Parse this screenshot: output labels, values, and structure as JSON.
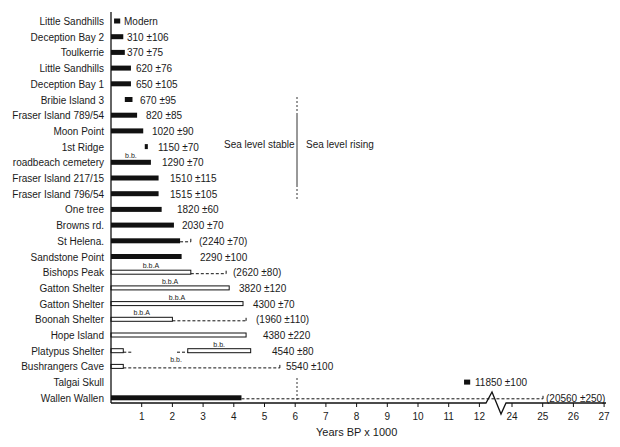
{
  "chart_data": {
    "type": "bar",
    "orientation": "horizontal",
    "title": "",
    "xlabel": "Years BP x 1000",
    "ylabel": "",
    "x_ticks": [
      "1",
      "2",
      "3",
      "4",
      "5",
      "6",
      "7",
      "8",
      "9",
      "10",
      "11",
      "12",
      "24",
      "25",
      "26",
      "27"
    ],
    "axis_break": {
      "between": [
        12,
        24
      ]
    },
    "xlim": [
      0,
      27
    ],
    "grid": false,
    "legend": null,
    "annotations": [
      {
        "text": "Sea level stable",
        "position": "left of 6000 BP divider"
      },
      {
        "text": "Sea level rising",
        "position": "right of 6000 BP divider"
      },
      {
        "text": "6000 BP reference line (dashed)",
        "x": 6.05
      }
    ],
    "rows": [
      {
        "site": "Little Sandhills",
        "date_label": "Modern",
        "style": "solid",
        "start": 0.1,
        "end": 0.3
      },
      {
        "site": "Deception Bay 2",
        "date_label": "310 ±106",
        "style": "solid",
        "start": 0.0,
        "end": 0.4
      },
      {
        "site": "Toulkerrie",
        "date_label": "370 ±75",
        "style": "solid",
        "start": 0.0,
        "end": 0.45
      },
      {
        "site": "Little Sandhills",
        "date_label": "620 ±76",
        "style": "solid",
        "start": 0.0,
        "end": 0.65
      },
      {
        "site": "Deception Bay 1",
        "date_label": "650 ±105",
        "style": "solid",
        "start": 0.0,
        "end": 0.65
      },
      {
        "site": "Bribie Island 3",
        "date_label": "670 ±95",
        "style": "solid",
        "start": 0.45,
        "end": 0.7
      },
      {
        "site": "Fraser Island 789/54",
        "date_label": "820 ±85",
        "style": "solid",
        "start": 0.0,
        "end": 0.85
      },
      {
        "site": "Moon Point",
        "date_label": "1020 ±90",
        "style": "solid",
        "start": 0.0,
        "end": 1.05
      },
      {
        "site": "1st Ridge",
        "date_label": "1150 ±70",
        "style": "solid",
        "start": 1.1,
        "end": 1.2
      },
      {
        "site": "roadbeach cemetery",
        "date_label": "1290 ±70",
        "style": "solid",
        "start": 0.0,
        "end": 1.3,
        "note": "b.b."
      },
      {
        "site": "Fraser Island 217/15",
        "date_label": "1510 ±115",
        "style": "solid",
        "start": 0.0,
        "end": 1.55
      },
      {
        "site": "Fraser Island 796/54",
        "date_label": "1515 ±105",
        "style": "solid",
        "start": 0.0,
        "end": 1.55
      },
      {
        "site": "One tree",
        "date_label": "1820 ±60",
        "style": "solid",
        "start": 0.0,
        "end": 1.65
      },
      {
        "site": "Browns rd.",
        "date_label": "2030 ±70",
        "style": "solid",
        "start": 0.0,
        "end": 2.05
      },
      {
        "site": "St Helena.",
        "date_label": "(2240 ±70)",
        "style": "solid",
        "start": 0.0,
        "end": 2.25,
        "dashed_to": 2.6
      },
      {
        "site": "Sandstone Point",
        "date_label": "2290 ±100",
        "style": "solid",
        "start": 0.0,
        "end": 2.3
      },
      {
        "site": "Bishops Peak",
        "date_label": "(2620 ±80)",
        "style": "open",
        "start": 0.0,
        "end": 2.6,
        "dashed_to": 3.75,
        "note": "b.b.A"
      },
      {
        "site": "Gatton Shelter",
        "date_label": "3820 ±120",
        "style": "open",
        "start": 0.0,
        "end": 3.85,
        "note": "b.b.A"
      },
      {
        "site": "Gatton Shelter",
        "date_label": "4300 ±70",
        "style": "open",
        "start": 0.0,
        "end": 4.3,
        "note": "b.b.A"
      },
      {
        "site": "Boonah Shelter",
        "date_label": "(1960 ±110)",
        "style": "open",
        "start": 0.0,
        "end": 2.0,
        "dashed_to": 4.4,
        "note": "b.b.A"
      },
      {
        "site": "Hope Island",
        "date_label": "4380 ±220",
        "style": "open",
        "start": 0.0,
        "end": 4.4
      },
      {
        "site": "Platypus Shelter",
        "date_label": "4540 ±80",
        "style": "open",
        "segments": [
          [
            0.0,
            0.4
          ],
          [
            2.5,
            4.55
          ]
        ],
        "dashed": [
          [
            0.4,
            0.7
          ],
          [
            2.15,
            2.5
          ]
        ],
        "note": "b.b."
      },
      {
        "site": "Bushrangers Cave",
        "date_label": "5540 ±100",
        "style": "open",
        "start": 0.0,
        "end": 0.4,
        "dashed_to": 5.5,
        "note": "b.b."
      },
      {
        "site": "Talgai Skull",
        "date_label": "11850 ±100",
        "style": "solid",
        "start": 11.5,
        "end": 11.7
      },
      {
        "site": "Wallen Wallen",
        "date_label": "(20560 ±250)",
        "style": "solid",
        "start": 0.0,
        "end": 4.25,
        "dashed_to": 25.0
      }
    ]
  },
  "labels": {
    "xlabel": "Years BP x 1000",
    "sea_stable": "Sea level stable",
    "sea_rising": "Sea level rising"
  }
}
